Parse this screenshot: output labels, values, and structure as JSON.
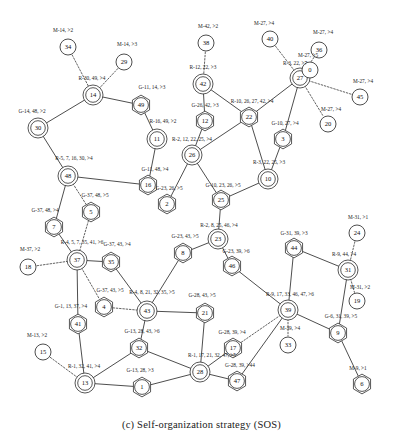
{
  "caption": "(c) Self-organization strategy (SOS)",
  "figure": {
    "type": "network-graph",
    "title": "Self-organization strategy (SOS)",
    "node_shapes": {
      "circle": "plain member node",
      "double-circle": "cluster head node",
      "hexagon": "gateway node"
    },
    "edge_styles": {
      "solid": "backbone link",
      "dotted": "member association"
    }
  },
  "nodes": [
    {
      "id": "34",
      "x": 68,
      "y": 47,
      "shape": "circle"
    },
    {
      "id": "29",
      "x": 124,
      "y": 62,
      "shape": "circle"
    },
    {
      "id": "14",
      "x": 93,
      "y": 95,
      "shape": "double-circle"
    },
    {
      "id": "49",
      "x": 141,
      "y": 105,
      "shape": "hexagon"
    },
    {
      "id": "30",
      "x": 38,
      "y": 128,
      "shape": "double-circle"
    },
    {
      "id": "11",
      "x": 157,
      "y": 139,
      "shape": "double-circle"
    },
    {
      "id": "48",
      "x": 68,
      "y": 176,
      "shape": "double-circle"
    },
    {
      "id": "16",
      "x": 148,
      "y": 185,
      "shape": "hexagon"
    },
    {
      "id": "5",
      "x": 91,
      "y": 212,
      "shape": "hexagon"
    },
    {
      "id": "7",
      "x": 54,
      "y": 227,
      "shape": "hexagon"
    },
    {
      "id": "2",
      "x": 167,
      "y": 204,
      "shape": "hexagon"
    },
    {
      "id": "18",
      "x": 28,
      "y": 267,
      "shape": "circle"
    },
    {
      "id": "37",
      "x": 77,
      "y": 260,
      "shape": "double-circle"
    },
    {
      "id": "35",
      "x": 111,
      "y": 262,
      "shape": "hexagon"
    },
    {
      "id": "8",
      "x": 183,
      "y": 253,
      "shape": "hexagon"
    },
    {
      "id": "4",
      "x": 104,
      "y": 307,
      "shape": "hexagon"
    },
    {
      "id": "41",
      "x": 78,
      "y": 324,
      "shape": "hexagon"
    },
    {
      "id": "43",
      "x": 147,
      "y": 311,
      "shape": "double-circle"
    },
    {
      "id": "21",
      "x": 205,
      "y": 313,
      "shape": "hexagon"
    },
    {
      "id": "32",
      "x": 139,
      "y": 348,
      "shape": "hexagon"
    },
    {
      "id": "15",
      "x": 43,
      "y": 352,
      "shape": "circle"
    },
    {
      "id": "13",
      "x": 85,
      "y": 383,
      "shape": "double-circle"
    },
    {
      "id": "1",
      "x": 142,
      "y": 387,
      "shape": "hexagon"
    },
    {
      "id": "28",
      "x": 200,
      "y": 372,
      "shape": "double-circle"
    },
    {
      "id": "17",
      "x": 233,
      "y": 348,
      "shape": "hexagon"
    },
    {
      "id": "47",
      "x": 237,
      "y": 381,
      "shape": "hexagon"
    },
    {
      "id": "38",
      "x": 206,
      "y": 43,
      "shape": "circle"
    },
    {
      "id": "42",
      "x": 203,
      "y": 84,
      "shape": "double-circle"
    },
    {
      "id": "12",
      "x": 205,
      "y": 121,
      "shape": "hexagon"
    },
    {
      "id": "26",
      "x": 192,
      "y": 155,
      "shape": "double-circle"
    },
    {
      "id": "22",
      "x": 249,
      "y": 117,
      "shape": "hexagon"
    },
    {
      "id": "40",
      "x": 270,
      "y": 39,
      "shape": "circle"
    },
    {
      "id": "27",
      "x": 300,
      "y": 78,
      "shape": "double-circle"
    },
    {
      "id": "36",
      "x": 319,
      "y": 50,
      "shape": "circle"
    },
    {
      "id": "0",
      "x": 310,
      "y": 70,
      "shape": "circle"
    },
    {
      "id": "45",
      "x": 360,
      "y": 97,
      "shape": "circle"
    },
    {
      "id": "20",
      "x": 328,
      "y": 124,
      "shape": "circle"
    },
    {
      "id": "3",
      "x": 283,
      "y": 139,
      "shape": "hexagon"
    },
    {
      "id": "10",
      "x": 268,
      "y": 179,
      "shape": "double-circle"
    },
    {
      "id": "25",
      "x": 221,
      "y": 200,
      "shape": "hexagon"
    },
    {
      "id": "23",
      "x": 218,
      "y": 239,
      "shape": "double-circle"
    },
    {
      "id": "46",
      "x": 232,
      "y": 266,
      "shape": "hexagon"
    },
    {
      "id": "44",
      "x": 294,
      "y": 248,
      "scale": 1,
      "shape": "hexagon"
    },
    {
      "id": "39",
      "x": 288,
      "y": 310,
      "shape": "double-circle"
    },
    {
      "id": "33",
      "x": 288,
      "y": 345,
      "shape": "circle"
    },
    {
      "id": "31",
      "x": 348,
      "y": 270,
      "shape": "double-circle"
    },
    {
      "id": "24",
      "x": 357,
      "y": 233,
      "shape": "circle"
    },
    {
      "id": "19",
      "x": 357,
      "y": 301,
      "shape": "circle"
    },
    {
      "id": "9",
      "x": 338,
      "y": 333,
      "shape": "hexagon"
    },
    {
      "id": "6",
      "x": 362,
      "y": 384,
      "shape": "hexagon"
    }
  ],
  "edges": [
    {
      "from": "34",
      "to": "14",
      "style": "dotted"
    },
    {
      "from": "29",
      "to": "14",
      "style": "dotted"
    },
    {
      "from": "14",
      "to": "49",
      "style": "solid"
    },
    {
      "from": "14",
      "to": "30",
      "style": "solid"
    },
    {
      "from": "49",
      "to": "11",
      "style": "solid"
    },
    {
      "from": "11",
      "to": "16",
      "style": "solid"
    },
    {
      "from": "30",
      "to": "48",
      "style": "solid"
    },
    {
      "from": "48",
      "to": "16",
      "style": "solid"
    },
    {
      "from": "48",
      "to": "5",
      "style": "dotted"
    },
    {
      "from": "48",
      "to": "7",
      "style": "solid"
    },
    {
      "from": "7",
      "to": "37",
      "style": "solid"
    },
    {
      "from": "5",
      "to": "37",
      "style": "dotted"
    },
    {
      "from": "18",
      "to": "37",
      "style": "dotted"
    },
    {
      "from": "37",
      "to": "35",
      "style": "solid"
    },
    {
      "from": "37",
      "to": "41",
      "style": "solid"
    },
    {
      "from": "37",
      "to": "4",
      "style": "dotted"
    },
    {
      "from": "35",
      "to": "43",
      "style": "solid"
    },
    {
      "from": "4",
      "to": "43",
      "style": "dotted"
    },
    {
      "from": "41",
      "to": "13",
      "style": "solid"
    },
    {
      "from": "15",
      "to": "13",
      "style": "dotted"
    },
    {
      "from": "43",
      "to": "32",
      "style": "solid"
    },
    {
      "from": "43",
      "to": "21",
      "style": "solid"
    },
    {
      "from": "43",
      "to": "8",
      "style": "solid"
    },
    {
      "from": "32",
      "to": "13",
      "style": "solid"
    },
    {
      "from": "32",
      "to": "28",
      "style": "solid"
    },
    {
      "from": "13",
      "to": "1",
      "style": "solid"
    },
    {
      "from": "1",
      "to": "28",
      "style": "solid"
    },
    {
      "from": "21",
      "to": "28",
      "style": "solid"
    },
    {
      "from": "28",
      "to": "47",
      "style": "solid"
    },
    {
      "from": "8",
      "to": "23",
      "style": "solid"
    },
    {
      "from": "2",
      "to": "26",
      "style": "solid"
    },
    {
      "from": "38",
      "to": "42",
      "style": "dotted"
    },
    {
      "from": "42",
      "to": "12",
      "style": "solid"
    },
    {
      "from": "42",
      "to": "22",
      "style": "solid"
    },
    {
      "from": "12",
      "to": "26",
      "style": "solid"
    },
    {
      "from": "26",
      "to": "22",
      "style": "solid"
    },
    {
      "from": "26",
      "to": "25",
      "style": "solid"
    },
    {
      "from": "22",
      "to": "27",
      "style": "solid"
    },
    {
      "from": "22",
      "to": "10",
      "style": "solid"
    },
    {
      "from": "40",
      "to": "27",
      "style": "dotted"
    },
    {
      "from": "36",
      "to": "27",
      "style": "dotted"
    },
    {
      "from": "0",
      "to": "27",
      "style": "dotted"
    },
    {
      "from": "27",
      "to": "45",
      "style": "dotted"
    },
    {
      "from": "27",
      "to": "20",
      "style": "dotted"
    },
    {
      "from": "27",
      "to": "3",
      "style": "solid"
    },
    {
      "from": "3",
      "to": "10",
      "style": "solid"
    },
    {
      "from": "10",
      "to": "25",
      "style": "solid"
    },
    {
      "from": "25",
      "to": "23",
      "style": "solid"
    },
    {
      "from": "23",
      "to": "46",
      "style": "solid"
    },
    {
      "from": "46",
      "to": "39",
      "style": "solid"
    },
    {
      "from": "44",
      "to": "39",
      "style": "solid"
    },
    {
      "from": "44",
      "to": "31",
      "style": "solid"
    },
    {
      "from": "24",
      "to": "31",
      "style": "dotted"
    },
    {
      "from": "31",
      "to": "19",
      "style": "dotted"
    },
    {
      "from": "31",
      "to": "9",
      "style": "solid"
    },
    {
      "from": "39",
      "to": "9",
      "style": "solid"
    },
    {
      "from": "39",
      "to": "33",
      "style": "dotted"
    },
    {
      "from": "39",
      "to": "17",
      "style": "dotted"
    },
    {
      "from": "39",
      "to": "47",
      "style": "solid"
    },
    {
      "from": "9",
      "to": "6",
      "style": "solid"
    },
    {
      "from": "17",
      "to": "28",
      "style": "solid"
    }
  ],
  "edge_labels": [
    {
      "text": "M-14, >2",
      "x": 63,
      "y": 31
    },
    {
      "text": "M-14, >3",
      "x": 127,
      "y": 45
    },
    {
      "text": "R-30, 49, >4",
      "x": 92,
      "y": 79
    },
    {
      "text": "G-11, 14, >3",
      "x": 152,
      "y": 88
    },
    {
      "text": "G-14, 48, >2",
      "x": 32,
      "y": 112
    },
    {
      "text": "R-16, 49, >2",
      "x": 163,
      "y": 122
    },
    {
      "text": "R-5, 7, 16, 30, >4",
      "x": 74,
      "y": 159
    },
    {
      "text": "G-11, 48, >4",
      "x": 155,
      "y": 170
    },
    {
      "text": "G-37, 48, >5",
      "x": 95,
      "y": 196
    },
    {
      "text": "G-37, 48, >4",
      "x": 45,
      "y": 211
    },
    {
      "text": "G-23, 26, >5",
      "x": 169,
      "y": 189
    },
    {
      "text": "M-37, >2",
      "x": 30,
      "y": 250
    },
    {
      "text": "R-4, 5, 7, 35, 41, >6",
      "x": 82,
      "y": 243
    },
    {
      "text": "G-37, 43, >4",
      "x": 117,
      "y": 245
    },
    {
      "text": "G-23, 43, >5",
      "x": 185,
      "y": 237
    },
    {
      "text": "G-37, 43, >5",
      "x": 110,
      "y": 291
    },
    {
      "text": "G-1, 13, 37, >4",
      "x": 71,
      "y": 307
    },
    {
      "text": "R-4, 8, 21, 32, 35, >5",
      "x": 152,
      "y": 293
    },
    {
      "text": "G-28, 43, >5",
      "x": 202,
      "y": 296
    },
    {
      "text": "G-13, 28, 43, >6",
      "x": 142,
      "y": 332
    },
    {
      "text": "M-13, >2",
      "x": 37,
      "y": 336
    },
    {
      "text": "R-1, 32, 41, >4",
      "x": 84,
      "y": 367
    },
    {
      "text": "G-13, 28, >3",
      "x": 140,
      "y": 371
    },
    {
      "text": "R-1, 17, 21, 32, 47, >5",
      "x": 212,
      "y": 356
    },
    {
      "text": "G-28, 39, >4",
      "x": 232,
      "y": 333
    },
    {
      "text": "G-28, 39, >44",
      "x": 240,
      "y": 366
    },
    {
      "text": "M-42, >2",
      "x": 208,
      "y": 27
    },
    {
      "text": "M-27, >4",
      "x": 264,
      "y": 24
    },
    {
      "text": "M-27, >4",
      "x": 323,
      "y": 33
    },
    {
      "text": "M-27, >5",
      "x": 308,
      "y": 56
    },
    {
      "text": "R-12, 22, >3",
      "x": 203,
      "y": 68
    },
    {
      "text": "R-3, 22, >7",
      "x": 295,
      "y": 64
    },
    {
      "text": "M-27, >4",
      "x": 363,
      "y": 82
    },
    {
      "text": "G-26, 42, >3",
      "x": 205,
      "y": 106
    },
    {
      "text": "R-10, 26, 27, 42, >4",
      "x": 252,
      "y": 102
    },
    {
      "text": "G-10, 27, >4",
      "x": 285,
      "y": 124
    },
    {
      "text": "M-27, >4",
      "x": 331,
      "y": 110
    },
    {
      "text": "R-2, 12, 22, 25, >4",
      "x": 192,
      "y": 140
    },
    {
      "text": "R-3, 22, 25, >3",
      "x": 269,
      "y": 163
    },
    {
      "text": "G-10, 23, 26, >5",
      "x": 223,
      "y": 186
    },
    {
      "text": "R-2, 8, 25, 46, >4",
      "x": 219,
      "y": 226
    },
    {
      "text": "G-23, 39, >6",
      "x": 236,
      "y": 252
    },
    {
      "text": "G-31, 39, >3",
      "x": 294,
      "y": 234
    },
    {
      "text": "R-9, 44, >4",
      "x": 344,
      "y": 255
    },
    {
      "text": "M-31, >1",
      "x": 358,
      "y": 218
    },
    {
      "text": "M-31, >2",
      "x": 360,
      "y": 288
    },
    {
      "text": "R-9, 17, 33, 46, 47, >6",
      "x": 290,
      "y": 295
    },
    {
      "text": "M-39, >4",
      "x": 290,
      "y": 329
    },
    {
      "text": "G-6, 31, 39, >5",
      "x": 341,
      "y": 317
    },
    {
      "text": "M-9, >1",
      "x": 358,
      "y": 369
    }
  ]
}
